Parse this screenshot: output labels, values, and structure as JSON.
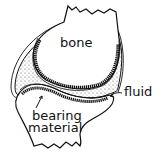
{
  "diagram": {
    "labels": {
      "bone": "bone",
      "fluid": "fluid",
      "bearing_material_line1": "bearing",
      "bearing_material_line2": "material"
    }
  }
}
